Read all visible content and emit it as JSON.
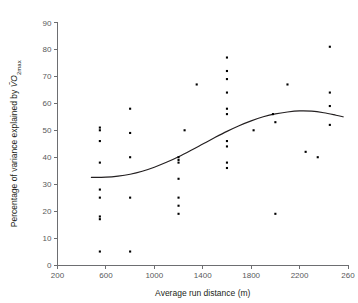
{
  "chart_data": {
    "type": "scatter",
    "title": "",
    "xlabel": "Average run distance (m)",
    "ylabel": "Percentage of variance explained by VO2max",
    "ylabel_parts": {
      "prefix": "Percentage of variance explained by ",
      "symbol": "VO",
      "subscript": "2max"
    },
    "xlim": [
      200,
      2600
    ],
    "ylim": [
      0,
      90
    ],
    "xticks": [
      200,
      600,
      1000,
      1400,
      1800,
      2200,
      2600
    ],
    "xtick_labels": [
      "200",
      "600",
      "1000",
      "1400",
      "1800",
      "2200",
      "260"
    ],
    "yticks": [
      0,
      10,
      20,
      30,
      40,
      50,
      60,
      70,
      80,
      90
    ],
    "ytick_labels": [
      "0",
      "10",
      "20",
      "30",
      "40",
      "50",
      "60",
      "70",
      "80",
      "90"
    ],
    "grid": false,
    "legend": null,
    "marker": "square",
    "marker_color": "#000000",
    "points": [
      {
        "x": 550,
        "y": 51
      },
      {
        "x": 550,
        "y": 50
      },
      {
        "x": 550,
        "y": 46
      },
      {
        "x": 550,
        "y": 38
      },
      {
        "x": 550,
        "y": 28
      },
      {
        "x": 550,
        "y": 25
      },
      {
        "x": 550,
        "y": 18
      },
      {
        "x": 550,
        "y": 17
      },
      {
        "x": 550,
        "y": 5
      },
      {
        "x": 800,
        "y": 58
      },
      {
        "x": 800,
        "y": 49
      },
      {
        "x": 800,
        "y": 40
      },
      {
        "x": 800,
        "y": 25
      },
      {
        "x": 800,
        "y": 5
      },
      {
        "x": 1200,
        "y": 40
      },
      {
        "x": 1200,
        "y": 39
      },
      {
        "x": 1200,
        "y": 38
      },
      {
        "x": 1200,
        "y": 32
      },
      {
        "x": 1200,
        "y": 25
      },
      {
        "x": 1200,
        "y": 22
      },
      {
        "x": 1200,
        "y": 19
      },
      {
        "x": 1250,
        "y": 50
      },
      {
        "x": 1350,
        "y": 67
      },
      {
        "x": 1600,
        "y": 77
      },
      {
        "x": 1600,
        "y": 72
      },
      {
        "x": 1600,
        "y": 69
      },
      {
        "x": 1600,
        "y": 64
      },
      {
        "x": 1600,
        "y": 58
      },
      {
        "x": 1600,
        "y": 56
      },
      {
        "x": 1600,
        "y": 46
      },
      {
        "x": 1600,
        "y": 44
      },
      {
        "x": 1600,
        "y": 38
      },
      {
        "x": 1600,
        "y": 36
      },
      {
        "x": 1820,
        "y": 50
      },
      {
        "x": 1980,
        "y": 56
      },
      {
        "x": 2000,
        "y": 19
      },
      {
        "x": 2000,
        "y": 53
      },
      {
        "x": 2100,
        "y": 67
      },
      {
        "x": 2250,
        "y": 42
      },
      {
        "x": 2350,
        "y": 40
      },
      {
        "x": 2450,
        "y": 81
      },
      {
        "x": 2450,
        "y": 64
      },
      {
        "x": 2450,
        "y": 59
      },
      {
        "x": 2450,
        "y": 52
      }
    ],
    "fit_line": {
      "name": "smoothed trend",
      "color": "#231f20",
      "points": [
        {
          "x": 480,
          "y": 32.5
        },
        {
          "x": 600,
          "y": 32.6
        },
        {
          "x": 700,
          "y": 33.0
        },
        {
          "x": 800,
          "y": 33.7
        },
        {
          "x": 900,
          "y": 34.8
        },
        {
          "x": 1000,
          "y": 36.3
        },
        {
          "x": 1100,
          "y": 38.1
        },
        {
          "x": 1200,
          "y": 40.2
        },
        {
          "x": 1300,
          "y": 42.5
        },
        {
          "x": 1400,
          "y": 44.9
        },
        {
          "x": 1500,
          "y": 47.3
        },
        {
          "x": 1600,
          "y": 49.6
        },
        {
          "x": 1700,
          "y": 51.7
        },
        {
          "x": 1800,
          "y": 53.5
        },
        {
          "x": 1900,
          "y": 55.0
        },
        {
          "x": 2000,
          "y": 56.1
        },
        {
          "x": 2100,
          "y": 56.8
        },
        {
          "x": 2200,
          "y": 57.2
        },
        {
          "x": 2300,
          "y": 57.1
        },
        {
          "x": 2400,
          "y": 56.5
        },
        {
          "x": 2500,
          "y": 55.6
        },
        {
          "x": 2560,
          "y": 55.0
        }
      ]
    }
  }
}
